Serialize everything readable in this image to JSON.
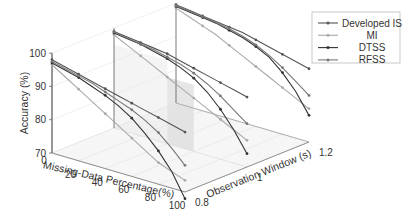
{
  "chart_data": {
    "type": "line",
    "subtype": "3d-waterfall",
    "title": "",
    "xlabel": "Missing-Data Percentage(%)",
    "ylabel": "Observation Window (s)",
    "zlabel": "Accuracy (%)",
    "x_ticks": [
      "0",
      "20",
      "40",
      "60",
      "80",
      "100"
    ],
    "y_ticks": [
      "0.8",
      "1",
      "1.2"
    ],
    "z_ticks": [
      "70",
      "80",
      "90",
      "100"
    ],
    "xlim": [
      0,
      100
    ],
    "ylim": [
      0.8,
      1.2
    ],
    "zlim": [
      70,
      100
    ],
    "grid": true,
    "legend_position": "upper right",
    "x": [
      0,
      10,
      20,
      30,
      40,
      50,
      60,
      70,
      80,
      90,
      100
    ],
    "windows": [
      0.8,
      1.0,
      1.2
    ],
    "series": [
      {
        "name": "Developed IS",
        "color": "#555555",
        "values": {
          "0.8": [
            98,
            97,
            96,
            95,
            94,
            93,
            92,
            91,
            90,
            89,
            88
          ],
          "1.0": [
            99,
            98.5,
            98,
            97.5,
            97,
            96,
            95,
            94,
            93,
            92,
            91
          ],
          "1.2": [
            99.5,
            99,
            98.5,
            98,
            97.5,
            97,
            96,
            95,
            94,
            93,
            92
          ]
        }
      },
      {
        "name": "MI",
        "color": "#aaaaaa",
        "values": {
          "0.8": [
            96.5,
            94,
            91.5,
            89,
            86.5,
            84,
            81.5,
            79,
            76.5,
            75,
            73.5
          ],
          "1.0": [
            98,
            96,
            94,
            92,
            90,
            88,
            86,
            84,
            82,
            80,
            78
          ],
          "1.2": [
            98.5,
            97,
            95.5,
            94,
            92,
            90,
            88,
            86,
            84,
            82,
            80
          ]
        }
      },
      {
        "name": "DTSS",
        "color": "#333333",
        "values": {
          "0.8": [
            97,
            96,
            95,
            93.5,
            92,
            90,
            87.5,
            84,
            80,
            75,
            68
          ],
          "1.0": [
            98.5,
            98,
            97.5,
            96.5,
            95.5,
            94,
            92,
            89,
            85,
            80,
            74
          ],
          "1.2": [
            99,
            98.5,
            98,
            97.5,
            96.5,
            95.5,
            94,
            92,
            88.5,
            84,
            78
          ]
        }
      },
      {
        "name": "RFSS",
        "color": "#777777",
        "values": {
          "0.8": [
            97.5,
            96.5,
            95.5,
            94.5,
            93,
            91.5,
            90,
            88,
            85.5,
            82,
            78
          ],
          "1.0": [
            98.8,
            98.2,
            97.6,
            97,
            96,
            95,
            93.5,
            91.5,
            89,
            86,
            83
          ],
          "1.2": [
            99.2,
            98.8,
            98.3,
            97.7,
            97,
            96,
            94.5,
            92.5,
            90,
            87,
            84
          ]
        }
      }
    ]
  }
}
